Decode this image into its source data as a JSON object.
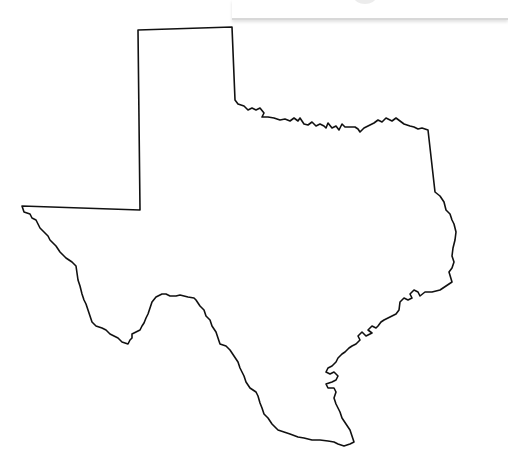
{
  "map": {
    "subject": "Texas state outline",
    "stroke_color": "#111111",
    "fill_color": "#ffffff",
    "background": "#ffffff"
  },
  "top_bar": {
    "visible": true
  }
}
